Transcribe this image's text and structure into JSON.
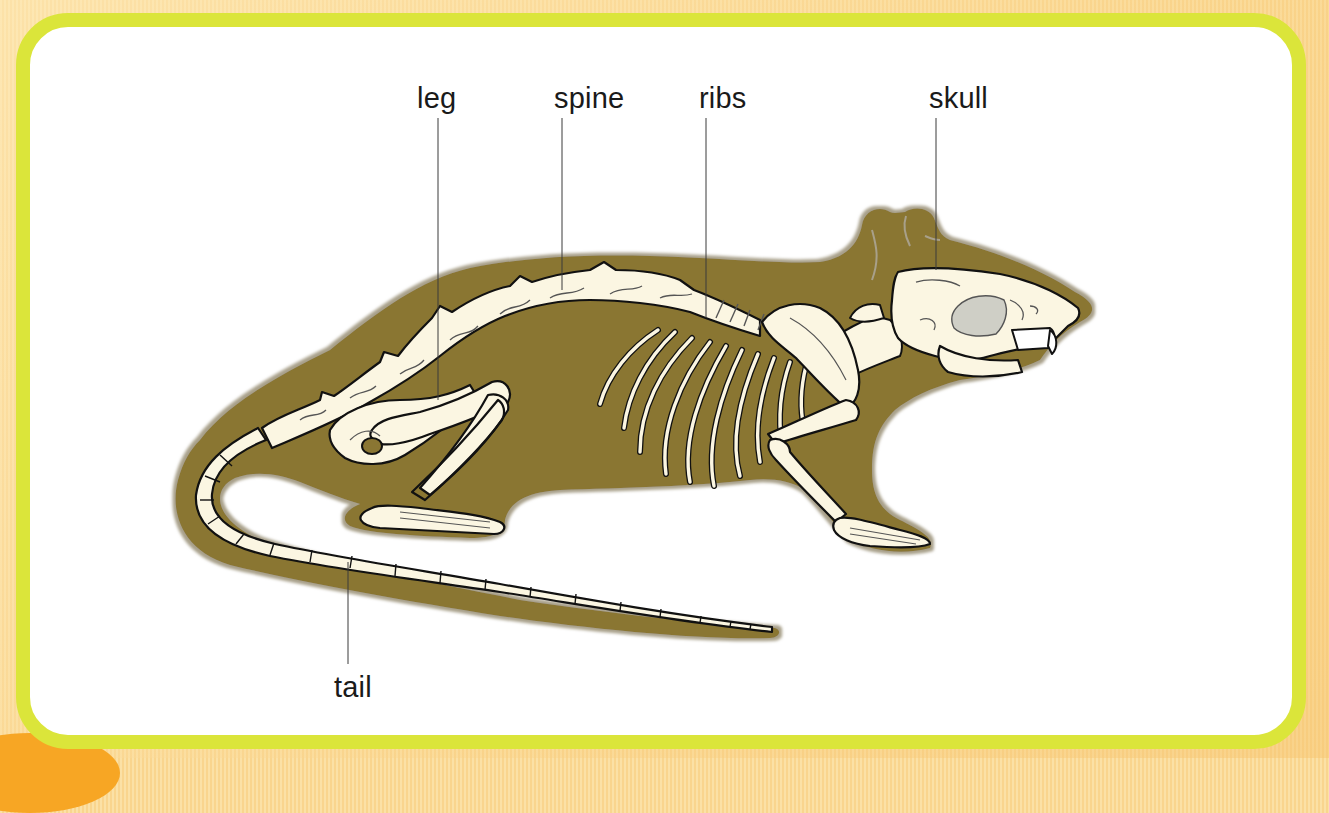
{
  "diagram": {
    "labels": {
      "leg": "leg",
      "spine": "spine",
      "ribs": "ribs",
      "skull": "skull",
      "tail": "tail"
    }
  },
  "colors": {
    "border": "#dbe53a",
    "panel": "#ffffff",
    "body": "#8a7633",
    "body_halo": "#a8a08a",
    "bone": "#fbf6e2",
    "bone_outline": "#111111",
    "bone_detail": "#555555",
    "skull_shade": "#cfcfc6",
    "background": "#fadb9a",
    "accent_orange": "#f7a624"
  }
}
